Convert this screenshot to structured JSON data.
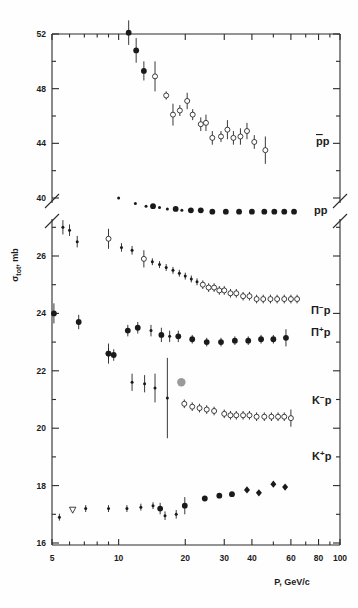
{
  "chart_data": {
    "type": "scatter",
    "title": "",
    "subtitle": "",
    "xlabel": "P, GeV/c",
    "ylabel": "σ tot, mb",
    "ylabel_main": "σ",
    "ylabel_sub": "tot",
    "ylabel_unit": ", mb",
    "xscale": "log",
    "xlim": [
      5,
      110
    ],
    "xticks": [
      5,
      10,
      20,
      30,
      40,
      60,
      80,
      100
    ],
    "xticklabels": [
      "5",
      "10",
      "20",
      "30",
      "40",
      "60",
      "80",
      "100"
    ],
    "xminorticks": [
      6,
      7,
      8,
      9,
      50,
      70,
      90
    ],
    "grid": false,
    "legend_position": "right-inline",
    "axis_break": {
      "present": true,
      "upper_range": [
        39.2,
        52
      ],
      "lower_range": [
        15.6,
        27.2
      ],
      "note": "y-axis broken between ~40 and ~26"
    },
    "yticks_upper": [
      40,
      44,
      48,
      52
    ],
    "yticklabels_upper": [
      "40",
      "44",
      "48",
      "52"
    ],
    "yminorticks_upper": [
      42,
      46,
      50
    ],
    "yticks_lower": [
      16,
      18,
      20,
      22,
      24,
      26
    ],
    "yticklabels_lower": [
      "16",
      "18",
      "20",
      "22",
      "24",
      "26"
    ],
    "yminorticks_lower": [
      17,
      19,
      21,
      23,
      25,
      27
    ],
    "series": [
      {
        "name": "̅pp",
        "label": "p̅p",
        "label_display": "pp",
        "label_overline": true,
        "marker": "mixed-filled-open-circle",
        "panel": "upper",
        "points": [
          {
            "x": 11.1,
            "y": 52.1,
            "err": 0.9,
            "marker": "filled"
          },
          {
            "x": 12.0,
            "y": 50.8,
            "err": 0.9,
            "marker": "filled"
          },
          {
            "x": 13.0,
            "y": 49.3,
            "err": 0.7,
            "marker": "filled"
          },
          {
            "x": 14.6,
            "y": 48.9,
            "err": 1.1,
            "marker": "open"
          },
          {
            "x": 16.4,
            "y": 47.5,
            "err": 0.3,
            "marker": "open"
          },
          {
            "x": 17.6,
            "y": 46.1,
            "err": 0.8,
            "marker": "open"
          },
          {
            "x": 18.9,
            "y": 46.4,
            "err": 0.4,
            "marker": "open"
          },
          {
            "x": 20.4,
            "y": 47.1,
            "err": 0.6,
            "marker": "open"
          },
          {
            "x": 21.6,
            "y": 46.1,
            "err": 0.4,
            "marker": "open"
          },
          {
            "x": 23.5,
            "y": 45.4,
            "err": 0.5,
            "marker": "open"
          },
          {
            "x": 24.8,
            "y": 45.5,
            "err": 0.6,
            "marker": "open"
          },
          {
            "x": 26.5,
            "y": 44.4,
            "err": 0.5,
            "marker": "open"
          },
          {
            "x": 29.0,
            "y": 44.5,
            "err": 0.4,
            "marker": "open"
          },
          {
            "x": 31.0,
            "y": 45.0,
            "err": 0.7,
            "marker": "open"
          },
          {
            "x": 33.0,
            "y": 44.4,
            "err": 0.5,
            "marker": "open"
          },
          {
            "x": 35.5,
            "y": 44.5,
            "err": 0.6,
            "marker": "open"
          },
          {
            "x": 38.0,
            "y": 44.9,
            "err": 0.6,
            "marker": "open"
          },
          {
            "x": 41.0,
            "y": 44.1,
            "err": 0.5,
            "marker": "open"
          },
          {
            "x": 46.0,
            "y": 43.5,
            "err": 1.0,
            "marker": "open"
          }
        ]
      },
      {
        "name": "pp",
        "label": "pp",
        "label_display": "pp",
        "label_overline": false,
        "marker": "filled-circle",
        "panel": "upper",
        "points": [
          {
            "x": 10.0,
            "y": 40.0,
            "err": 0.0,
            "marker": "filled-small"
          },
          {
            "x": 11.9,
            "y": 39.6,
            "err": 0.0,
            "marker": "filled-small"
          },
          {
            "x": 13.3,
            "y": 39.4,
            "err": 0.0,
            "marker": "filled-small"
          },
          {
            "x": 14.3,
            "y": 39.4,
            "err": 0.0,
            "marker": "filled"
          },
          {
            "x": 15.3,
            "y": 39.3,
            "err": 0.0,
            "marker": "filled-small"
          },
          {
            "x": 16.6,
            "y": 39.2,
            "err": 0.0,
            "marker": "filled-small"
          },
          {
            "x": 18.1,
            "y": 39.2,
            "err": 0.0,
            "marker": "filled"
          },
          {
            "x": 19.3,
            "y": 39.1,
            "err": 0.0,
            "marker": "filled-small"
          },
          {
            "x": 21.2,
            "y": 39.1,
            "err": 0.0,
            "marker": "filled"
          },
          {
            "x": 23.5,
            "y": 39.1,
            "err": 0.0,
            "marker": "filled"
          },
          {
            "x": 26.5,
            "y": 39.0,
            "err": 0.0,
            "marker": "filled"
          },
          {
            "x": 30.5,
            "y": 39.0,
            "err": 0.0,
            "marker": "filled"
          },
          {
            "x": 35.0,
            "y": 39.0,
            "err": 0.0,
            "marker": "filled"
          },
          {
            "x": 40.0,
            "y": 39.0,
            "err": 0.0,
            "marker": "filled"
          },
          {
            "x": 45.5,
            "y": 39.0,
            "err": 0.0,
            "marker": "filled"
          },
          {
            "x": 50.5,
            "y": 39.0,
            "err": 0.0,
            "marker": "filled"
          },
          {
            "x": 56.0,
            "y": 39.0,
            "err": 0.0,
            "marker": "filled"
          },
          {
            "x": 62.0,
            "y": 39.0,
            "err": 0.0,
            "marker": "filled"
          }
        ]
      },
      {
        "name": "π-p",
        "label": "π⁻p",
        "label_display": "Π",
        "label_charge": "−",
        "label_target": "p",
        "marker": "open-circle",
        "panel": "lower",
        "points": [
          {
            "x": 5.6,
            "y": 27.0,
            "err": 0.25,
            "marker": "filled-small"
          },
          {
            "x": 6.0,
            "y": 26.9,
            "err": 0.2,
            "marker": "filled-small"
          },
          {
            "x": 6.5,
            "y": 26.5,
            "err": 0.2,
            "marker": "filled-small"
          },
          {
            "x": 9.0,
            "y": 26.6,
            "err": 0.35,
            "marker": "open"
          },
          {
            "x": 10.3,
            "y": 26.3,
            "err": 0.15,
            "marker": "filled-small"
          },
          {
            "x": 11.5,
            "y": 26.2,
            "err": 0.15,
            "marker": "filled-small"
          },
          {
            "x": 13.0,
            "y": 25.9,
            "err": 0.3,
            "marker": "open"
          },
          {
            "x": 14.2,
            "y": 25.8,
            "err": 0.12,
            "marker": "filled-small"
          },
          {
            "x": 15.3,
            "y": 25.7,
            "err": 0.12,
            "marker": "filled-small"
          },
          {
            "x": 16.4,
            "y": 25.6,
            "err": 0.12,
            "marker": "filled-small"
          },
          {
            "x": 17.6,
            "y": 25.5,
            "err": 0.12,
            "marker": "filled-small"
          },
          {
            "x": 18.8,
            "y": 25.4,
            "err": 0.12,
            "marker": "filled-small"
          },
          {
            "x": 20.0,
            "y": 25.3,
            "err": 0.12,
            "marker": "filled-small"
          },
          {
            "x": 21.3,
            "y": 25.2,
            "err": 0.12,
            "marker": "filled-small"
          },
          {
            "x": 22.6,
            "y": 25.1,
            "err": 0.12,
            "marker": "filled-small"
          },
          {
            "x": 24.0,
            "y": 25.0,
            "err": 0.15,
            "marker": "open"
          },
          {
            "x": 25.5,
            "y": 24.9,
            "err": 0.15,
            "marker": "open"
          },
          {
            "x": 27.0,
            "y": 24.9,
            "err": 0.15,
            "marker": "open"
          },
          {
            "x": 28.5,
            "y": 24.8,
            "err": 0.15,
            "marker": "open"
          },
          {
            "x": 30.0,
            "y": 24.8,
            "err": 0.15,
            "marker": "open"
          },
          {
            "x": 32.0,
            "y": 24.7,
            "err": 0.15,
            "marker": "open"
          },
          {
            "x": 34.0,
            "y": 24.7,
            "err": 0.15,
            "marker": "open"
          },
          {
            "x": 36.5,
            "y": 24.6,
            "err": 0.15,
            "marker": "open"
          },
          {
            "x": 39.0,
            "y": 24.6,
            "err": 0.15,
            "marker": "open"
          },
          {
            "x": 42.0,
            "y": 24.5,
            "err": 0.15,
            "marker": "open"
          },
          {
            "x": 45.0,
            "y": 24.5,
            "err": 0.15,
            "marker": "open"
          },
          {
            "x": 48.5,
            "y": 24.5,
            "err": 0.15,
            "marker": "open"
          },
          {
            "x": 52.0,
            "y": 24.5,
            "err": 0.15,
            "marker": "open"
          },
          {
            "x": 56.0,
            "y": 24.5,
            "err": 0.15,
            "marker": "open"
          },
          {
            "x": 60.0,
            "y": 24.5,
            "err": 0.15,
            "marker": "open"
          },
          {
            "x": 64.0,
            "y": 24.5,
            "err": 0.15,
            "marker": "open"
          }
        ]
      },
      {
        "name": "π+p",
        "label": "π⁺pi",
        "label_display": "Π",
        "label_charge": "+",
        "label_target": "p",
        "marker": "filled-circle",
        "panel": "lower",
        "points": [
          {
            "x": 5.1,
            "y": 24.0,
            "err": 0.35,
            "marker": "filled"
          },
          {
            "x": 6.6,
            "y": 23.7,
            "err": 0.25,
            "marker": "filled"
          },
          {
            "x": 9.0,
            "y": 22.6,
            "err": 0.2,
            "marker": "open"
          },
          {
            "x": 9.5,
            "y": 22.55,
            "err": 0.2,
            "marker": "filled"
          },
          {
            "x": 11.0,
            "y": 23.4,
            "err": 0.2,
            "marker": "filled"
          },
          {
            "x": 12.2,
            "y": 23.5,
            "err": 0.2,
            "marker": "filled"
          },
          {
            "x": 14.0,
            "y": 23.4,
            "err": 0.2,
            "marker": "filled-small"
          },
          {
            "x": 15.6,
            "y": 23.25,
            "err": 0.25,
            "marker": "filled"
          },
          {
            "x": 17.0,
            "y": 23.2,
            "err": 0.2,
            "marker": "filled-small"
          },
          {
            "x": 18.6,
            "y": 23.2,
            "err": 0.2,
            "marker": "filled"
          },
          {
            "x": 21.5,
            "y": 23.1,
            "err": 0.15,
            "marker": "filled"
          },
          {
            "x": 25.0,
            "y": 23.0,
            "err": 0.15,
            "marker": "filled"
          },
          {
            "x": 29.0,
            "y": 23.0,
            "err": 0.15,
            "marker": "filled"
          },
          {
            "x": 33.5,
            "y": 23.05,
            "err": 0.15,
            "marker": "filled"
          },
          {
            "x": 38.5,
            "y": 23.05,
            "err": 0.15,
            "marker": "filled"
          },
          {
            "x": 44.0,
            "y": 23.1,
            "err": 0.15,
            "marker": "filled"
          },
          {
            "x": 50.0,
            "y": 23.1,
            "err": 0.15,
            "marker": "filled"
          },
          {
            "x": 57.0,
            "y": 23.15,
            "err": 0.3,
            "marker": "filled"
          }
        ]
      },
      {
        "name": "K-p",
        "label": "K⁻p",
        "label_display": "K",
        "label_charge": "−",
        "label_target": "p",
        "marker": "open-circle",
        "panel": "lower",
        "points": [
          {
            "x": 9.0,
            "y": 22.6,
            "err": 0.35,
            "marker": "filled"
          },
          {
            "x": 11.5,
            "y": 21.6,
            "err": 0.3,
            "marker": "filled-small"
          },
          {
            "x": 13.1,
            "y": 21.55,
            "err": 0.3,
            "marker": "filled-small"
          },
          {
            "x": 14.6,
            "y": 21.4,
            "err": 0.5,
            "marker": "filled-small"
          },
          {
            "x": 16.6,
            "y": 21.05,
            "err": 1.4,
            "marker": "filled-small"
          },
          {
            "x": 19.2,
            "y": 21.6,
            "err": 0.0,
            "marker": "gray"
          },
          {
            "x": 19.8,
            "y": 20.85,
            "err": 0.15,
            "marker": "open"
          },
          {
            "x": 21.5,
            "y": 20.75,
            "err": 0.15,
            "marker": "open"
          },
          {
            "x": 23.2,
            "y": 20.7,
            "err": 0.15,
            "marker": "open"
          },
          {
            "x": 25.0,
            "y": 20.65,
            "err": 0.15,
            "marker": "open"
          },
          {
            "x": 27.0,
            "y": 20.6,
            "err": 0.15,
            "marker": "open"
          },
          {
            "x": 30.0,
            "y": 20.5,
            "err": 0.15,
            "marker": "open"
          },
          {
            "x": 32.0,
            "y": 20.45,
            "err": 0.15,
            "marker": "open"
          },
          {
            "x": 34.0,
            "y": 20.45,
            "err": 0.15,
            "marker": "open"
          },
          {
            "x": 36.5,
            "y": 20.45,
            "err": 0.15,
            "marker": "open"
          },
          {
            "x": 39.0,
            "y": 20.45,
            "err": 0.15,
            "marker": "open"
          },
          {
            "x": 42.0,
            "y": 20.4,
            "err": 0.15,
            "marker": "open"
          },
          {
            "x": 45.5,
            "y": 20.4,
            "err": 0.15,
            "marker": "open"
          },
          {
            "x": 49.0,
            "y": 20.4,
            "err": 0.15,
            "marker": "open"
          },
          {
            "x": 52.5,
            "y": 20.4,
            "err": 0.15,
            "marker": "open"
          },
          {
            "x": 56.0,
            "y": 20.4,
            "err": 0.15,
            "marker": "open"
          },
          {
            "x": 60.0,
            "y": 20.35,
            "err": 0.3,
            "marker": "open"
          }
        ]
      },
      {
        "name": "K+p",
        "label": "K⁺p",
        "label_display": "K",
        "label_charge": "+",
        "label_target": "p",
        "marker": "filled-diamond",
        "panel": "lower",
        "points": [
          {
            "x": 5.4,
            "y": 16.9,
            "err": 0.12,
            "marker": "filled-small"
          },
          {
            "x": 6.2,
            "y": 17.15,
            "err": 0.0,
            "marker": "tri-down"
          },
          {
            "x": 7.1,
            "y": 17.2,
            "err": 0.12,
            "marker": "filled-small"
          },
          {
            "x": 9.0,
            "y": 17.2,
            "err": 0.12,
            "marker": "filled-small"
          },
          {
            "x": 10.9,
            "y": 17.2,
            "err": 0.12,
            "marker": "filled-small"
          },
          {
            "x": 12.6,
            "y": 17.25,
            "err": 0.12,
            "marker": "filled-small"
          },
          {
            "x": 14.3,
            "y": 17.3,
            "err": 0.12,
            "marker": "filled-small"
          },
          {
            "x": 15.4,
            "y": 17.2,
            "err": 0.2,
            "marker": "filled"
          },
          {
            "x": 16.2,
            "y": 16.95,
            "err": 0.15,
            "marker": "filled-small"
          },
          {
            "x": 18.2,
            "y": 17.0,
            "err": 0.15,
            "marker": "filled-small"
          },
          {
            "x": 19.9,
            "y": 17.3,
            "err": 0.3,
            "marker": "filled"
          },
          {
            "x": 24.5,
            "y": 17.55,
            "err": 0.0,
            "marker": "filled"
          },
          {
            "x": 28.5,
            "y": 17.65,
            "err": 0.0,
            "marker": "filled"
          },
          {
            "x": 32.5,
            "y": 17.7,
            "err": 0.0,
            "marker": "filled"
          },
          {
            "x": 38.0,
            "y": 17.85,
            "err": 0.0,
            "marker": "diamond"
          },
          {
            "x": 43.0,
            "y": 17.75,
            "err": 0.0,
            "marker": "diamond"
          },
          {
            "x": 50.0,
            "y": 18.05,
            "err": 0.0,
            "marker": "diamond"
          },
          {
            "x": 56.5,
            "y": 17.95,
            "err": 0.0,
            "marker": "diamond"
          }
        ]
      }
    ],
    "annotations": [
      {
        "text": "p̅p",
        "x_px": 316,
        "y_px": 145
      },
      {
        "text": "pp",
        "x_px": 314,
        "y_px": 214
      },
      {
        "text": "π⁻p",
        "x_px": 311,
        "y_px": 314
      },
      {
        "text": "π⁺p",
        "x_px": 311,
        "y_px": 336
      },
      {
        "text": "K⁻p",
        "x_px": 312,
        "y_px": 404
      },
      {
        "text": "K⁺p",
        "x_px": 312,
        "y_px": 460
      }
    ]
  }
}
